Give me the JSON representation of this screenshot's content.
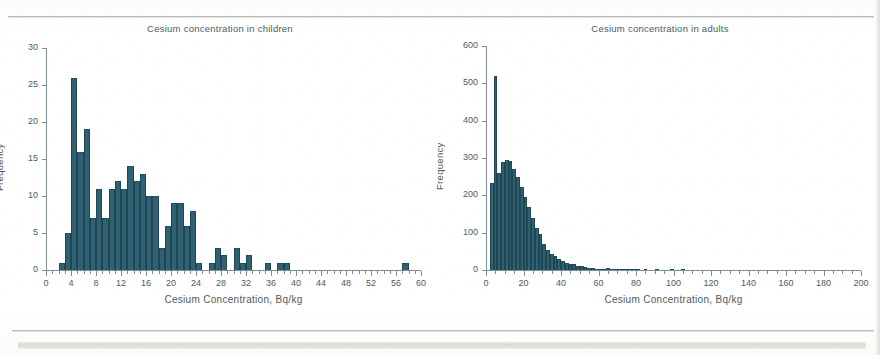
{
  "page": {
    "kind": "scanned-journal-page",
    "bar_color": "#2f6173",
    "axis_color": "#7d8f96",
    "text_color": "#4e5b62"
  },
  "charts": [
    {
      "id": "children",
      "title": "Cesium concentration in children",
      "xlabel": "Cesium Concentration, Bq/kg",
      "ylabel": "Frequency",
      "yticks": [
        0,
        5,
        10,
        15,
        20,
        25,
        30
      ],
      "xticks": [
        0,
        4,
        8,
        12,
        16,
        20,
        24,
        28,
        32,
        36,
        40,
        44,
        48,
        52,
        56,
        60
      ]
    },
    {
      "id": "adults",
      "title": "Cesium concentration in adults",
      "xlabel": "Cesium Concentration, Bq/kg",
      "ylabel": "Frequency",
      "yticks": [
        0,
        100,
        200,
        300,
        400,
        500,
        600
      ],
      "xticks": [
        0,
        20,
        40,
        60,
        80,
        100,
        120,
        140,
        160,
        180,
        200
      ]
    }
  ],
  "chart_data": [
    {
      "type": "bar",
      "id": "children",
      "title": "Cesium concentration in children",
      "xlabel": "Cesium Concentration, Bq/kg",
      "ylabel": "Frequency",
      "xlim": [
        0,
        60
      ],
      "ylim": [
        0,
        30
      ],
      "bin_width": 1,
      "grid": false,
      "legend": "none",
      "bin_starts": [
        2,
        3,
        4,
        5,
        6,
        7,
        8,
        9,
        10,
        11,
        12,
        13,
        14,
        15,
        16,
        17,
        18,
        19,
        20,
        21,
        22,
        23,
        24,
        25,
        26,
        27,
        28,
        29,
        30,
        31,
        32,
        33,
        34,
        35,
        36,
        37,
        38,
        39,
        40,
        41,
        42,
        43,
        44,
        45,
        46,
        47,
        48,
        49,
        50,
        51,
        52,
        53,
        54,
        55,
        56,
        57,
        58,
        59
      ],
      "values": [
        1,
        5,
        26,
        16,
        19,
        7,
        11,
        7,
        11,
        12,
        11,
        14,
        12,
        13,
        10,
        10,
        3,
        6,
        9,
        9,
        6,
        8,
        1,
        0,
        1,
        3,
        2,
        0,
        3,
        1,
        2,
        0,
        0,
        1,
        0,
        1,
        1,
        0,
        0,
        0,
        0,
        0,
        0,
        0,
        0,
        0,
        0,
        0,
        0,
        0,
        0,
        0,
        0,
        0,
        0,
        1,
        0,
        0
      ]
    },
    {
      "type": "bar",
      "id": "adults",
      "title": "Cesium concentration in adults",
      "xlabel": "Cesium Concentration, Bq/kg",
      "ylabel": "Frequency",
      "xlim": [
        0,
        200
      ],
      "ylim": [
        0,
        600
      ],
      "bin_width": 2,
      "grid": false,
      "legend": "none",
      "bin_starts": [
        2,
        4,
        6,
        8,
        10,
        12,
        14,
        16,
        18,
        20,
        22,
        24,
        26,
        28,
        30,
        32,
        34,
        36,
        38,
        40,
        42,
        44,
        46,
        48,
        50,
        52,
        54,
        56,
        58,
        60,
        62,
        64,
        66,
        68,
        70,
        72,
        74,
        76,
        78,
        80,
        82,
        84,
        86,
        88,
        90,
        92,
        94,
        96,
        98,
        100,
        102,
        104,
        106,
        108,
        110,
        112,
        114,
        116,
        118,
        120,
        122,
        124,
        126,
        128,
        130,
        132,
        134,
        136,
        138,
        140,
        142,
        144,
        146,
        148,
        150,
        152,
        154,
        156,
        158,
        160,
        162,
        164,
        166,
        168,
        170,
        172,
        174,
        176,
        178,
        180,
        182,
        184,
        186,
        188,
        190,
        192,
        194,
        196,
        198
      ],
      "values": [
        232,
        519,
        260,
        290,
        296,
        292,
        270,
        250,
        222,
        196,
        170,
        140,
        112,
        96,
        70,
        54,
        44,
        38,
        30,
        24,
        20,
        17,
        16,
        12,
        10,
        8,
        6,
        5,
        4,
        4,
        3,
        6,
        4,
        2,
        2,
        1,
        1,
        1,
        1,
        1,
        0,
        1,
        0,
        0,
        1,
        0,
        0,
        0,
        1,
        0,
        0,
        1,
        0,
        0,
        0,
        0,
        0,
        0,
        0,
        0,
        0,
        0,
        0,
        0,
        0,
        0,
        0,
        0,
        0,
        0,
        0,
        0,
        0,
        0,
        0,
        0,
        0,
        0,
        0,
        0,
        0,
        0,
        0,
        0,
        0,
        0,
        0,
        0,
        0,
        0,
        0,
        0,
        0,
        0,
        0,
        0,
        0,
        0,
        0
      ]
    }
  ]
}
